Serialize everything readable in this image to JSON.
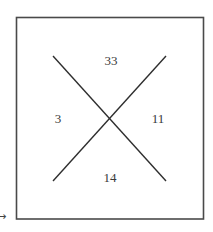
{
  "diagram": {
    "type": "x-in-square",
    "stroke_color": "#3a3a3a",
    "regions": {
      "top": {
        "value": "33"
      },
      "left": {
        "value": "3"
      },
      "right": {
        "value": "11"
      },
      "bottom": {
        "value": "14"
      }
    },
    "margin_marker": {
      "icon": "arrow-right-icon",
      "glyph": "→"
    }
  }
}
